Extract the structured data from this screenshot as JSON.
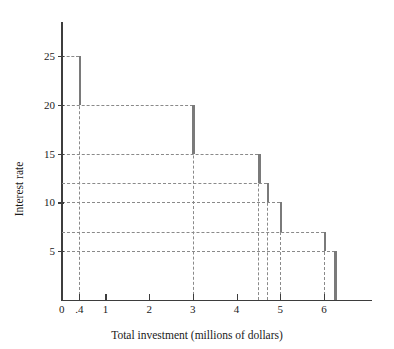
{
  "chart_data": {
    "type": "bar",
    "title": "",
    "subtitle": "",
    "xlabel": "Total investment (millions of dollars)",
    "ylabel": "Interest rate",
    "xlim": [
      0,
      7.1
    ],
    "ylim": [
      0,
      28.5
    ],
    "grid": true,
    "grid_style": "dashed",
    "legend": "none",
    "x_ticks": [
      {
        "value": 0,
        "label": "0"
      },
      {
        "value": 0.4,
        "label": ".4"
      },
      {
        "value": 1,
        "label": "1"
      },
      {
        "value": 2,
        "label": "2"
      },
      {
        "value": 3,
        "label": "3"
      },
      {
        "value": 4,
        "label": "4"
      },
      {
        "value": 5,
        "label": "5"
      },
      {
        "value": 6,
        "label": "6"
      }
    ],
    "y_ticks": [
      {
        "value": 25,
        "label": "25"
      },
      {
        "value": 20,
        "label": "20"
      },
      {
        "value": 15,
        "label": "15"
      },
      {
        "value": 10,
        "label": "10"
      },
      {
        "value": 5,
        "label": "5"
      }
    ],
    "y_gridlines": [
      25,
      20,
      15,
      12,
      10,
      7,
      5
    ],
    "x_gridlines": [
      0.4,
      3,
      4.5,
      4.7,
      5,
      6,
      6.25
    ],
    "series": [
      {
        "name": "Investment demand schedule",
        "color": "#7a7a7a",
        "steps": [
          {
            "x": 0.4,
            "rate_top": 25,
            "rate_bottom": 20,
            "label": "25"
          },
          {
            "x": 3.0,
            "rate_top": 20,
            "rate_bottom": 15,
            "label": "20"
          },
          {
            "x": 4.5,
            "rate_top": 15,
            "rate_bottom": 12,
            "label": "15"
          },
          {
            "x": 4.7,
            "rate_top": 12,
            "rate_bottom": 10,
            "label": "12"
          },
          {
            "x": 5.0,
            "rate_top": 10,
            "rate_bottom": 7,
            "label": "10"
          },
          {
            "x": 6.0,
            "rate_top": 7,
            "rate_bottom": 5,
            "label": "7"
          },
          {
            "x": 6.25,
            "rate_top": 5,
            "rate_bottom": 0,
            "label": "5"
          }
        ]
      }
    ]
  },
  "axes": {
    "x_axis_color": "#3d3d3d",
    "y_axis_color": "#3d3d3d",
    "gridline_color": "#8a8a8a",
    "bar_color": "#7a7a7a"
  }
}
